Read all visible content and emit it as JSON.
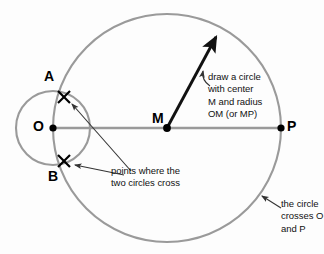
{
  "figure": {
    "background_color": "#fdfdfd",
    "stroke_color_circles": "#9a9a9a",
    "stroke_color_line": "#9a9a9a",
    "ink_color": "#111111"
  },
  "points": [
    {
      "name": "O",
      "label": "O",
      "x": 53,
      "y": 128,
      "marker": "dot"
    },
    {
      "name": "M",
      "label": "M",
      "x": 167,
      "y": 128,
      "marker": "dot"
    },
    {
      "name": "P",
      "label": "P",
      "x": 281,
      "y": 128,
      "marker": "dot"
    },
    {
      "name": "A",
      "label": "A",
      "x": 64,
      "y": 97,
      "marker": "cross"
    },
    {
      "name": "B",
      "label": "B",
      "x": 64,
      "y": 161,
      "marker": "cross"
    }
  ],
  "labels": {
    "A": "A",
    "B": "B",
    "O": "O",
    "M": "M",
    "P": "P"
  },
  "shapes": {
    "big_circle": {
      "cx": 167,
      "cy": 128,
      "r": 114
    },
    "small_circle": {
      "cx": 53,
      "cy": 128,
      "r": 37
    },
    "baseline": {
      "x1": 53,
      "y1": 128,
      "x2": 281,
      "y2": 128
    },
    "radius_arrow": {
      "x1": 167,
      "y1": 128,
      "x2": 218,
      "y2": 33
    }
  },
  "annotations": {
    "center_radius": "draw a circle\nwith center\nM and radius\nOM (or MP)",
    "cross_points": "points where the\ntwo circles cross",
    "crosses_o_and_p": "the circle\ncrosses O\nand P"
  }
}
